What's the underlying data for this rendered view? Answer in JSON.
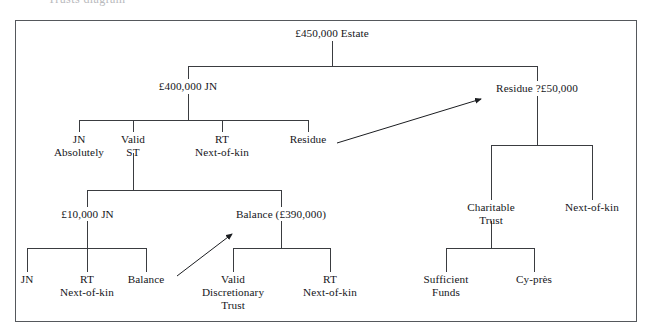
{
  "page": {
    "title_fragment": "Trusts diagram",
    "border_color": "#55585c",
    "line_color": "#3a3c40",
    "text_color": "#15161a",
    "background": "#ffffff"
  },
  "diagram": {
    "type": "tree",
    "name": "estate-distribution-tree",
    "nodes": [
      {
        "id": "estate",
        "label": "£450,000 Estate",
        "x": 332,
        "y": 33,
        "lines": 1
      },
      {
        "id": "jn400",
        "label": "£400,000 JN",
        "x": 188,
        "y": 86,
        "lines": 1
      },
      {
        "id": "residue50",
        "label": "Residue ?£50,000",
        "x": 537,
        "y": 88,
        "lines": 1
      },
      {
        "id": "jn-absolutely",
        "label": "JN\nAbsolutely",
        "x": 79,
        "y": 139,
        "lines": 2
      },
      {
        "id": "valid-st",
        "label": "Valid\nST",
        "x": 133,
        "y": 139,
        "lines": 2
      },
      {
        "id": "rt-nok-1",
        "label": "RT\nNext-of-kin",
        "x": 222,
        "y": 139,
        "lines": 2
      },
      {
        "id": "residue-leaf",
        "label": "Residue",
        "x": 308,
        "y": 139,
        "lines": 1
      },
      {
        "id": "charitable-trust",
        "label": "Charitable\nTrust",
        "x": 491,
        "y": 207,
        "lines": 2
      },
      {
        "id": "next-of-kin-right",
        "label": "Next-of-kin",
        "x": 592,
        "y": 207,
        "lines": 1
      },
      {
        "id": "jn10000",
        "label": "£10,000 JN",
        "x": 87,
        "y": 214,
        "lines": 1
      },
      {
        "id": "balance390",
        "label": "Balance (£390,000)",
        "x": 281,
        "y": 214,
        "lines": 1
      },
      {
        "id": "jn-leaf",
        "label": "JN",
        "x": 27,
        "y": 279,
        "lines": 1
      },
      {
        "id": "rt-nok-2",
        "label": "RT\nNext-of-kin",
        "x": 87,
        "y": 279,
        "lines": 2
      },
      {
        "id": "balance-leaf",
        "label": "Balance",
        "x": 146,
        "y": 279,
        "lines": 1
      },
      {
        "id": "valid-disc-trust",
        "label": "Valid\nDiscretionary\nTrust",
        "x": 233,
        "y": 279,
        "lines": 3
      },
      {
        "id": "rt-nok-3",
        "label": "RT\nNext-of-kin",
        "x": 330,
        "y": 279,
        "lines": 2
      },
      {
        "id": "sufficient-funds",
        "label": "Sufficient\nFunds",
        "x": 446,
        "y": 279,
        "lines": 2
      },
      {
        "id": "cy-pres",
        "label": "Cy-près",
        "x": 534,
        "y": 279,
        "lines": 1
      }
    ],
    "arrows": [
      {
        "id": "residue-to-residue50",
        "from": "residue-leaf",
        "to": "residue50",
        "x1": 337,
        "y1": 143,
        "x2": 484,
        "y2": 98
      },
      {
        "id": "balance-to-balance390",
        "from": "balance-leaf",
        "to": "balance390",
        "x1": 177,
        "y1": 276,
        "x2": 235,
        "y2": 231
      }
    ]
  }
}
